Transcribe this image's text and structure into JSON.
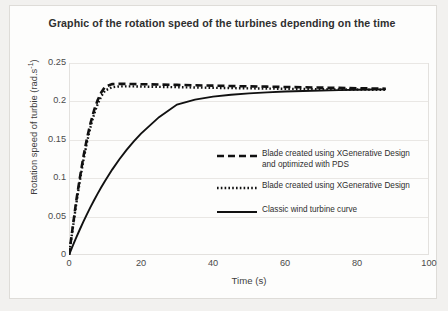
{
  "chart_data": {
    "type": "line",
    "title": "Graphic of the rotation speed of the turbines depending on the time",
    "xlabel": "Time (s)",
    "ylabel": "Rotation speed of turbie (rad.s-1)",
    "ylabel_base": "Rotation speed of turbie (rad.s",
    "ylabel_sup": "-1",
    "ylabel_close": ")",
    "xlim": [
      0,
      100
    ],
    "ylim": [
      0,
      0.25
    ],
    "grid": true,
    "legend_position": "inside-right",
    "xticks": [
      0,
      20,
      40,
      60,
      80,
      100
    ],
    "xtick_labels": [
      "0",
      "20",
      "40",
      "60",
      "80",
      "100"
    ],
    "yticks": [
      0,
      0.05,
      0.1,
      0.15,
      0.2,
      0.25
    ],
    "ytick_labels": [
      "0",
      "0.05",
      "0.1",
      "0.15",
      "0.2",
      "0.25"
    ],
    "x": [
      0,
      1,
      2,
      3,
      4,
      5,
      6,
      7,
      8,
      9,
      10,
      12,
      14,
      16,
      18,
      20,
      25,
      30,
      35,
      40,
      45,
      50,
      55,
      60,
      65,
      70,
      75,
      80,
      85,
      88
    ],
    "series": [
      {
        "name": "Blade created using XGenerative Design and optimized with PDS",
        "style": "dashed",
        "color": "#111111",
        "values": [
          0,
          0.035,
          0.07,
          0.1,
          0.128,
          0.152,
          0.172,
          0.189,
          0.202,
          0.212,
          0.219,
          0.2225,
          0.2228,
          0.2228,
          0.2226,
          0.2224,
          0.222,
          0.2215,
          0.221,
          0.2205,
          0.22,
          0.2196,
          0.2192,
          0.2188,
          0.2184,
          0.218,
          0.2176,
          0.2172,
          0.2168,
          0.2165
        ]
      },
      {
        "name": "Blade created using XGenerative Design",
        "style": "dotted",
        "color": "#111111",
        "values": [
          0,
          0.033,
          0.066,
          0.096,
          0.123,
          0.147,
          0.167,
          0.184,
          0.197,
          0.207,
          0.214,
          0.2185,
          0.2195,
          0.2196,
          0.2195,
          0.2193,
          0.2189,
          0.2185,
          0.2181,
          0.2177,
          0.2173,
          0.217,
          0.2167,
          0.2164,
          0.2161,
          0.2158,
          0.2156,
          0.2154,
          0.2152,
          0.2151
        ]
      },
      {
        "name": "Classic wind turbine curve",
        "style": "solid",
        "color": "#111111",
        "values": [
          0,
          0.0115,
          0.0226,
          0.0332,
          0.0434,
          0.0532,
          0.0626,
          0.0716,
          0.0802,
          0.0885,
          0.0964,
          0.1112,
          0.1247,
          0.1369,
          0.148,
          0.1581,
          0.1795,
          0.1959,
          0.2023,
          0.2062,
          0.2087,
          0.2105,
          0.2118,
          0.2128,
          0.2136,
          0.2142,
          0.2147,
          0.2151,
          0.2155,
          0.2157
        ]
      }
    ],
    "legend": [
      {
        "label_line1": "Blade created using XGenerative Design",
        "label_line2": "and optimized with PDS",
        "style": "dashed"
      },
      {
        "label_line1": "Blade created using XGenerative Design",
        "label_line2": "",
        "style": "dotted"
      },
      {
        "label_line1": "Classic wind turbine curve",
        "label_line2": "",
        "style": "solid"
      }
    ]
  }
}
